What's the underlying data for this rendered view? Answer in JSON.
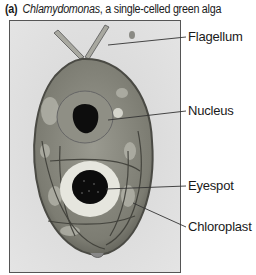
{
  "figure": {
    "panel_tag": "(a)",
    "genus": "Chlamydomonas",
    "caption_rest": ", a single-celled green alga",
    "image_alt": "Electron micrograph of Chlamydomonas cell",
    "labels": [
      {
        "id": "flagellum",
        "text": "Flagellum"
      },
      {
        "id": "nucleus",
        "text": "Nucleus"
      },
      {
        "id": "eyespot",
        "text": "Eyespot"
      },
      {
        "id": "chloroplast",
        "text": "Chloroplast"
      }
    ],
    "colors": {
      "background": "#dcdcdc",
      "cytoplasm": "#8a8a80",
      "dark_structure": "#111111",
      "leader_line": "#333333"
    }
  }
}
